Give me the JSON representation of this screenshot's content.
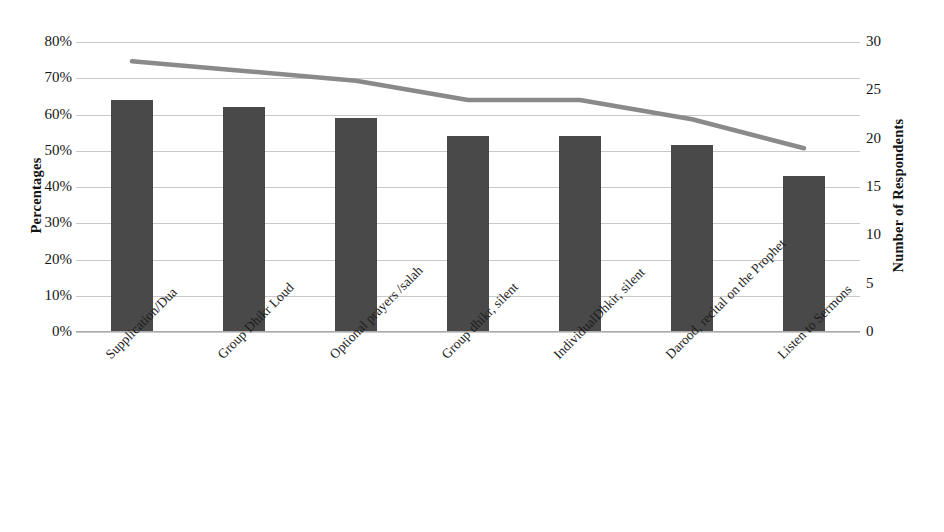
{
  "chart_data": {
    "type": "bar",
    "title": "",
    "subtitle": "",
    "xlabel": "",
    "ylabel": "Percentages",
    "y2label": "Number of Respondents",
    "grid": true,
    "legend": "none",
    "categories": [
      "Supplication/Dua",
      "Group Dhikr Loud",
      "Optional prayers /salah",
      "Group dhikr, silent",
      "IndividualDhkir, silent",
      "Darood, recital on the Prophet",
      "Listen to Sermons"
    ],
    "ylim": [
      0,
      0.8
    ],
    "y2lim": [
      0,
      30
    ],
    "yticks": [
      "0%",
      "10%",
      "20%",
      "30%",
      "40%",
      "50%",
      "60%",
      "70%",
      "80%"
    ],
    "ytick_values": [
      0,
      0.1,
      0.2,
      0.3,
      0.4,
      0.5,
      0.6,
      0.7,
      0.8
    ],
    "y2ticks": [
      "0",
      "5",
      "10",
      "15",
      "20",
      "25",
      "30"
    ],
    "y2tick_values": [
      0,
      5,
      10,
      15,
      20,
      25,
      30
    ],
    "series": [
      {
        "name": "Percentages",
        "type": "bar",
        "axis": "left",
        "color": "#494949",
        "values": [
          0.64,
          0.62,
          0.59,
          0.54,
          0.54,
          0.515,
          0.43
        ]
      },
      {
        "name": "Number of Respondents",
        "type": "line",
        "axis": "right",
        "color": "#8a8a8a",
        "values": [
          28,
          27,
          26,
          24,
          24,
          22,
          19
        ]
      }
    ]
  },
  "axes": {
    "left_title": "Percentages",
    "right_title": "Number of Respondents"
  }
}
